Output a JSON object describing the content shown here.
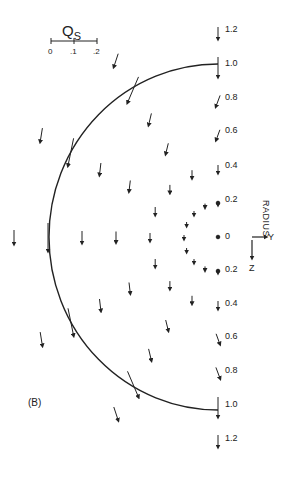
{
  "figure": {
    "panel_label": "(B)",
    "quantity_symbol": "Q",
    "quantity_subscript": "S",
    "scale_ticks": [
      "0",
      ".1",
      ".2"
    ],
    "axis_title": "RADIUS",
    "axis_y_label": "Y",
    "axis_z_label": "Z",
    "radius_labels_top": [
      "1.2",
      "1.0",
      "0.8",
      "0.6",
      "0.4",
      "0.2"
    ],
    "radius_label_center": "0",
    "radius_labels_bottom": [
      "0.2",
      "0.4",
      "0.6",
      "0.8",
      "1.0",
      "1.2"
    ]
  },
  "chart_data": {
    "type": "vector-field",
    "title": "",
    "panel": "(B)",
    "axis": "RADIUS",
    "coordinates": [
      "Y (right)",
      "Z (down)"
    ],
    "radial_ticks": [
      0,
      0.2,
      0.4,
      0.6,
      0.8,
      1.0,
      1.2
    ],
    "boundary_radius": 1.0,
    "vector_scale": {
      "label": "Q_S",
      "ticks": [
        0,
        0.1,
        0.2
      ]
    }
  }
}
